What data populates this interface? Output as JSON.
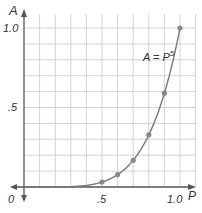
{
  "chart_data": {
    "type": "line",
    "title": "",
    "xlabel": "P",
    "ylabel": "A",
    "x_ticks": [
      "0",
      ".5",
      "1.0"
    ],
    "y_ticks": [
      ".5",
      "1.0"
    ],
    "xlim": [
      0,
      1.0
    ],
    "ylim": [
      0,
      1.0
    ],
    "grid": true,
    "annotation": "A = P^5",
    "series": [
      {
        "name": "A = P^5",
        "x": [
          0.5,
          0.6,
          0.7,
          0.8,
          0.9,
          1.0
        ],
        "values": [
          0.031,
          0.078,
          0.168,
          0.328,
          0.59,
          1.0
        ]
      }
    ]
  },
  "labels": {
    "y_axis": "A",
    "x_axis": "P",
    "origin": "0",
    "x_half": ".5",
    "x_one": "1.0",
    "y_half": ".5",
    "y_one": "1.0",
    "equation_main": "A = P",
    "equation_exp": "5"
  },
  "colors": {
    "grid": "#c8c8c8",
    "axis": "#555555",
    "curve": "#777777",
    "points": "#888888"
  }
}
